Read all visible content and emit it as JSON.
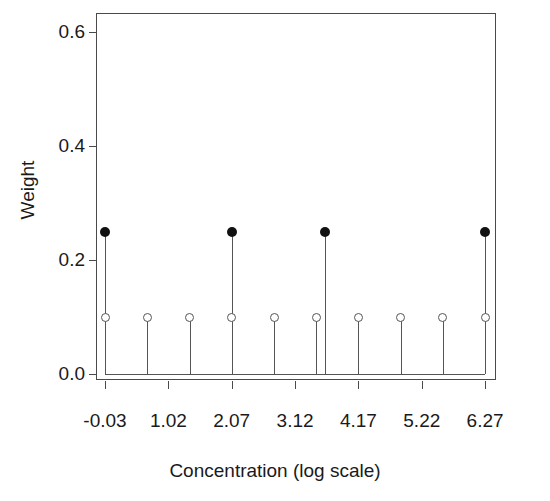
{
  "chart_data": {
    "type": "scatter",
    "title": "",
    "title_clipped": true,
    "xlabel": "Concentration (log scale)",
    "ylabel": "Weight",
    "xlim": [
      -0.18,
      6.45
    ],
    "ylim": [
      0.0,
      0.645
    ],
    "xticks": [
      -0.03,
      1.02,
      2.07,
      3.12,
      4.17,
      5.22,
      6.27
    ],
    "xtick_labels": [
      "-0.03",
      "1.02",
      "2.07",
      "3.12",
      "4.17",
      "5.22",
      "6.27"
    ],
    "yticks": [
      0.0,
      0.2,
      0.4,
      0.6
    ],
    "ytick_labels": [
      "0.0",
      "0.2",
      "0.4",
      "0.6"
    ],
    "grid": false,
    "legend": null,
    "series": [
      {
        "name": "open-circles",
        "marker": "open-circle",
        "color": "#555555",
        "stems": true,
        "x": [
          -0.03,
          0.67,
          1.37,
          2.07,
          2.77,
          3.47,
          4.17,
          4.87,
          5.57,
          6.27
        ],
        "y": [
          0.1,
          0.1,
          0.1,
          0.1,
          0.1,
          0.1,
          0.1,
          0.1,
          0.1,
          0.1
        ]
      },
      {
        "name": "filled-circles",
        "marker": "filled-circle",
        "color": "#111111",
        "stems": true,
        "x": [
          -0.03,
          2.07,
          3.62,
          6.27
        ],
        "y": [
          0.25,
          0.25,
          0.25,
          0.25
        ]
      }
    ]
  },
  "axes": {
    "x_title": "Concentration (log scale)",
    "y_title": "Weight"
  }
}
